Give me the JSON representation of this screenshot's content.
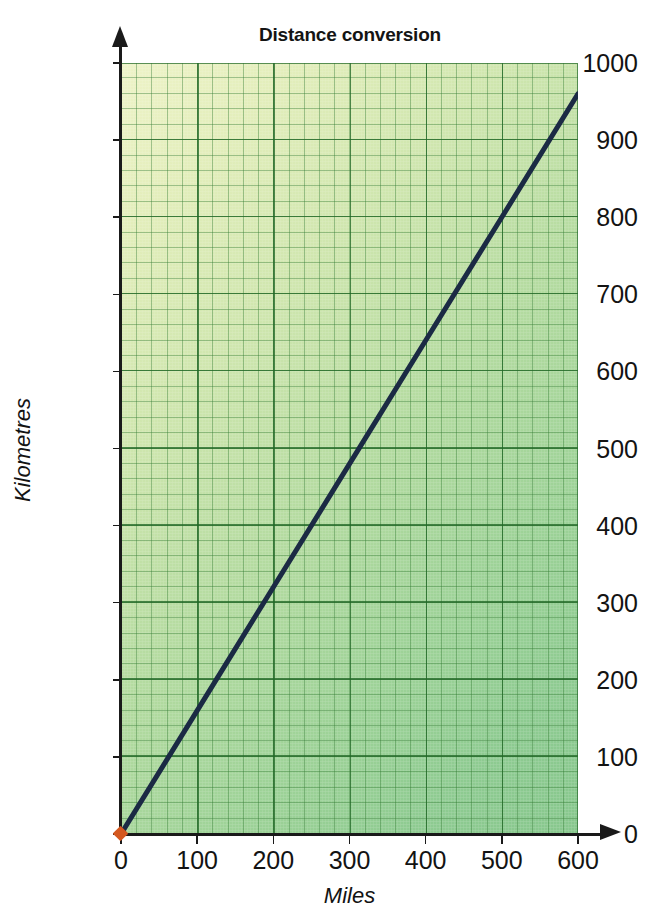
{
  "chart_data": {
    "type": "line",
    "title": "Distance conversion",
    "xlabel": "Miles",
    "ylabel": "Kilometres",
    "xlim": [
      0,
      600
    ],
    "ylim": [
      0,
      1000
    ],
    "xticks": [
      0,
      100,
      200,
      300,
      400,
      500,
      600
    ],
    "yticks": [
      0,
      100,
      200,
      300,
      400,
      500,
      600,
      700,
      800,
      900,
      1000
    ],
    "xtick_labels": [
      "0",
      "100",
      "200",
      "300",
      "400",
      "500",
      "600"
    ],
    "ytick_labels": [
      "0",
      "100",
      "200",
      "300",
      "400",
      "500",
      "600",
      "700",
      "800",
      "900",
      "1000"
    ],
    "grid": true,
    "grid_major_step_x": 100,
    "grid_major_step_y": 100,
    "grid_minor_step_x": 20,
    "grid_minor_step_y": 20,
    "legend": null,
    "series": [
      {
        "name": "miles-to-kilometres",
        "slope": 1.6,
        "x": [
          0,
          100,
          200,
          300,
          400,
          500,
          600
        ],
        "values": [
          0,
          160,
          320,
          480,
          640,
          800,
          960
        ],
        "color": "#1b2a44",
        "line_width": 4.5
      }
    ],
    "markers": [
      {
        "name": "origin-marker",
        "x": 0,
        "y": 0,
        "color": "#d4581f",
        "shape": "diamond"
      }
    ],
    "colors": {
      "plot_bg_light": "#eef3c8",
      "plot_bg_dark": "#87c78d",
      "grid_minor": "#347c34",
      "grid_major": "#216826",
      "axis": "#1a1a1a",
      "line": "#1b2a44",
      "marker": "#d4581f",
      "text": "#131313"
    }
  }
}
